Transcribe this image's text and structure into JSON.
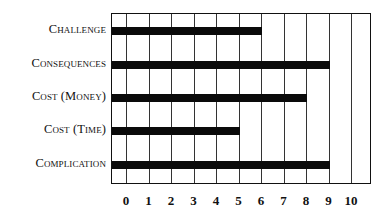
{
  "chart_data": {
    "type": "bar",
    "orientation": "horizontal",
    "title": "",
    "xlabel": "",
    "ylabel": "",
    "categories": [
      "Challenge",
      "Consequences",
      "Cost (Money)",
      "Cost (Time)",
      "Complication"
    ],
    "values": [
      6,
      9,
      8,
      5,
      9
    ],
    "xlim": [
      0,
      10
    ],
    "x_ticks": [
      "0",
      "1",
      "2",
      "3",
      "4",
      "5",
      "6",
      "7",
      "8",
      "9",
      "10"
    ],
    "grid": true,
    "legend": null,
    "bar_color": "#0a0a0a"
  }
}
